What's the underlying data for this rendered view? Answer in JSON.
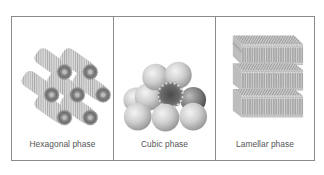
{
  "figure": {
    "panels": [
      {
        "id": "hexagonal",
        "caption": "Hexagonal phase",
        "illustration": "hexagonal-cylinder-bundle-icon"
      },
      {
        "id": "cubic",
        "caption": "Cubic phase",
        "illustration": "cubic-sphere-packing-icon"
      },
      {
        "id": "lamellar",
        "caption": "Lamellar phase",
        "illustration": "lamellar-bilayer-stack-icon"
      }
    ],
    "colors": {
      "border": "#8a8a8a",
      "caption_text": "#555555",
      "illustration_light": "#d6d6d6",
      "illustration_mid": "#a8a8a8",
      "illustration_dark": "#6a6a6a"
    }
  }
}
